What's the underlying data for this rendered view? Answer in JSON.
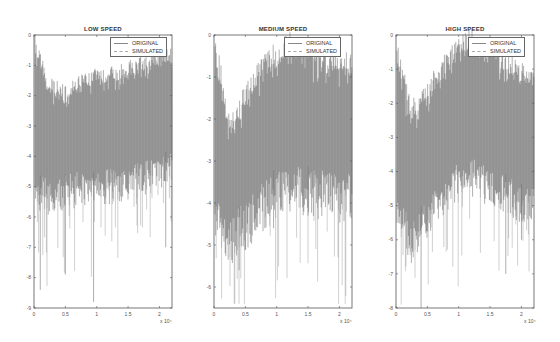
{
  "figure": {
    "panels": [
      {
        "id": "low",
        "title": "LOW SPEED",
        "x_offset": 34
      },
      {
        "id": "medium",
        "title": "MEDIUM SPEED",
        "x_offset": 214
      },
      {
        "id": "high",
        "title": "HIGH SPEED",
        "x_offset": 396
      }
    ],
    "legend": {
      "original": "ORIGINAL",
      "simulated": "SIMULATED"
    },
    "x_exponent_label": "x 10⁴",
    "colors": {
      "trace": "#3a3a3a",
      "trace_light": "#8a8a8a",
      "axis": "#555555",
      "background": "#ffffff"
    }
  },
  "chart_data": [
    {
      "type": "line",
      "title": "LOW SPEED",
      "xlabel": "",
      "ylabel": "",
      "x_ticks": [
        0,
        0.5,
        1,
        1.5,
        2
      ],
      "x_multiplier": "x 10^4",
      "xlim": [
        0,
        2.2
      ],
      "y_ticks": [
        0,
        -1,
        -2,
        -3,
        -4,
        -5,
        -6,
        -7,
        -8,
        -9
      ],
      "ylim": [
        -9,
        0
      ],
      "grid": false,
      "legend_position": "upper right",
      "series": [
        {
          "name": "ORIGINAL",
          "envelope_upper": [
            -0.5,
            -2.0,
            -2.2,
            -1.9,
            -1.7,
            -1.6,
            -1.5,
            -1.3,
            -1.1,
            -1.0
          ],
          "envelope_lower_dense": [
            -4.5,
            -4.8,
            -4.6,
            -4.5,
            -4.5,
            -4.4,
            -4.3,
            -4.2,
            -4.0,
            -3.8
          ]
        },
        {
          "name": "SIMULATED",
          "envelope_upper": [
            -0.5,
            -2.0,
            -2.2,
            -1.9,
            -1.7,
            -1.6,
            -1.5,
            -1.3,
            -1.1,
            -1.0
          ],
          "envelope_lower_dense": [
            -4.5,
            -4.8,
            -4.6,
            -4.5,
            -4.5,
            -4.4,
            -4.3,
            -4.2,
            -4.0,
            -3.8
          ]
        }
      ],
      "x_sample": [
        0,
        0.24,
        0.48,
        0.72,
        0.96,
        1.2,
        1.44,
        1.68,
        1.92,
        2.16
      ],
      "notable_spikes": [
        {
          "x": 0.1,
          "y": -8.4
        },
        {
          "x": 0.5,
          "y": -7.9
        },
        {
          "x": 0.95,
          "y": -8.8
        },
        {
          "x": 2.1,
          "y": -7.0
        }
      ]
    },
    {
      "type": "line",
      "title": "MEDIUM SPEED",
      "xlabel": "",
      "ylabel": "",
      "x_ticks": [
        0,
        0.5,
        1,
        1.5,
        2
      ],
      "x_multiplier": "x 10^4",
      "xlim": [
        0,
        2.2
      ],
      "y_ticks": [
        0,
        -1,
        -2,
        -3,
        -4,
        -5,
        -6
      ],
      "ylim": [
        -6.5,
        0
      ],
      "grid": false,
      "legend_position": "upper right",
      "series": [
        {
          "name": "ORIGINAL",
          "envelope_upper": [
            -0.3,
            -2.5,
            -1.8,
            -1.2,
            -0.8,
            -0.5,
            -0.6,
            -0.8,
            -0.9,
            -1.0
          ],
          "envelope_lower_dense": [
            -3.5,
            -4.3,
            -4.0,
            -3.6,
            -3.2,
            -3.0,
            -3.1,
            -3.2,
            -3.3,
            -3.3
          ]
        },
        {
          "name": "SIMULATED",
          "envelope_upper": [
            -0.3,
            -2.5,
            -1.8,
            -1.2,
            -0.8,
            -0.5,
            -0.6,
            -0.8,
            -0.9,
            -1.0
          ],
          "envelope_lower_dense": [
            -3.5,
            -4.3,
            -4.0,
            -3.6,
            -3.2,
            -3.0,
            -3.1,
            -3.2,
            -3.3,
            -3.3
          ]
        }
      ],
      "x_sample": [
        0,
        0.24,
        0.48,
        0.72,
        0.96,
        1.2,
        1.44,
        1.68,
        1.92,
        2.16
      ],
      "notable_spikes": [
        {
          "x": 0.4,
          "y": -5.6
        },
        {
          "x": 0.95,
          "y": -4.6
        },
        {
          "x": 1.5,
          "y": -4.3
        }
      ]
    },
    {
      "type": "line",
      "title": "HIGH SPEED",
      "xlabel": "",
      "ylabel": "",
      "x_ticks": [
        0,
        0.5,
        1,
        1.5,
        2
      ],
      "x_multiplier": "x 10^4",
      "xlim": [
        0,
        2.2
      ],
      "y_ticks": [
        0,
        -1,
        -2,
        -3,
        -4,
        -5,
        -6,
        -7,
        -8
      ],
      "ylim": [
        -8,
        0
      ],
      "grid": false,
      "legend_position": "upper right",
      "series": [
        {
          "name": "ORIGINAL",
          "envelope_upper": [
            -0.7,
            -2.5,
            -2.0,
            -1.3,
            -0.7,
            -0.4,
            -0.6,
            -1.0,
            -1.3,
            -1.5
          ],
          "envelope_lower_dense": [
            -4.5,
            -5.5,
            -4.8,
            -4.2,
            -3.8,
            -3.6,
            -3.8,
            -4.0,
            -4.3,
            -4.5
          ]
        },
        {
          "name": "SIMULATED",
          "envelope_upper": [
            -0.7,
            -2.5,
            -2.0,
            -1.3,
            -0.7,
            -0.4,
            -0.6,
            -1.0,
            -1.3,
            -1.5
          ],
          "envelope_lower_dense": [
            -4.5,
            -5.5,
            -4.8,
            -4.2,
            -3.8,
            -3.6,
            -3.8,
            -4.0,
            -4.3,
            -4.5
          ]
        }
      ],
      "x_sample": [
        0,
        0.24,
        0.48,
        0.72,
        0.96,
        1.2,
        1.44,
        1.68,
        1.92,
        2.16
      ],
      "notable_spikes": [
        {
          "x": 0.4,
          "y": -8.0
        },
        {
          "x": 1.75,
          "y": -7.0
        },
        {
          "x": 2.0,
          "y": -6.0
        }
      ]
    }
  ]
}
